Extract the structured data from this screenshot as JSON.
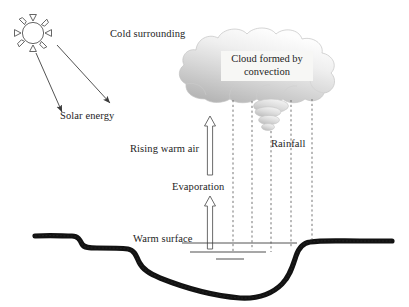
{
  "figure": {
    "kind": "scientific-diagram",
    "background_color": "#ffffff",
    "ink_color": "#1d1d1d",
    "terrain_color": "#111111",
    "cloud_fill_light": "#fcfcfc",
    "cloud_fill_dark": "#b9b9b9",
    "width": 409,
    "height": 307
  },
  "labels": {
    "cold_surrounding": "Cold surrounding",
    "cloud_line1": "Cloud formed by",
    "cloud_line2": "convection",
    "solar_energy": "Solar energy",
    "rising_warm_air": "Rising warm air",
    "rainfall": "Rainfall",
    "evaporation": "Evaporation",
    "warm_surface": "Warm surface"
  },
  "elements": {
    "sun": {
      "name": "sun",
      "rays": 8,
      "cx": 33,
      "cy": 33,
      "r": 11
    },
    "solar_arrows": [
      {
        "x1": 36,
        "y1": 52,
        "x2": 63,
        "y2": 113
      },
      {
        "x1": 56,
        "y1": 46,
        "x2": 111,
        "y2": 104
      }
    ],
    "cloud": {
      "x": 188,
      "y": 28,
      "w": 158,
      "h": 72
    },
    "cloud_puffs": [
      {
        "cx": 270,
        "cy": 107,
        "rx": 17,
        "ry": 7
      },
      {
        "cx": 268,
        "cy": 120,
        "rx": 11,
        "ry": 5
      }
    ],
    "rain_lines": [
      {
        "x": 233,
        "y1": 100,
        "y2": 252
      },
      {
        "x": 252,
        "y1": 101,
        "y2": 250
      },
      {
        "x": 271,
        "y1": 128,
        "y2": 252
      },
      {
        "x": 290,
        "y1": 100,
        "y2": 247
      },
      {
        "x": 311,
        "y1": 99,
        "y2": 240
      }
    ],
    "up_arrows": [
      {
        "name": "rising-warm-air-arrow",
        "x": 210,
        "y_tip": 117,
        "y_base": 174
      },
      {
        "name": "evaporation-arrow",
        "x": 210,
        "y_tip": 196,
        "y_base": 248
      }
    ],
    "water_lines": [
      {
        "x1": 190,
        "x2": 266,
        "y": 252
      },
      {
        "x1": 215,
        "x2": 243,
        "y": 259
      }
    ],
    "water_surface_line": {
      "x1": 182,
      "x2": 295,
      "y": 243
    }
  }
}
